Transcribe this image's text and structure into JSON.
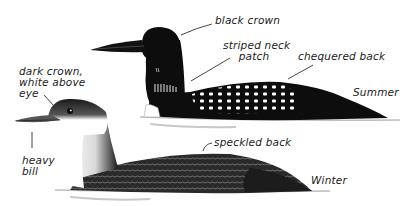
{
  "figure": {
    "birds": [
      {
        "id": "summer",
        "season_label": "Summer",
        "annotations": [
          {
            "id": "black-crown",
            "text": "black crown"
          },
          {
            "id": "striped-neck-patch",
            "line1": "striped neck",
            "line2": "patch"
          },
          {
            "id": "chequered-back",
            "text": "chequered back"
          }
        ]
      },
      {
        "id": "winter",
        "season_label": "Winter",
        "annotations": [
          {
            "id": "dark-crown",
            "line1": "dark crown,",
            "line2": "white above",
            "line3": "eye"
          },
          {
            "id": "heavy-bill",
            "line1": "heavy",
            "line2": "bill"
          },
          {
            "id": "speckled-back",
            "text": "speckled back"
          }
        ]
      }
    ]
  },
  "colors": {
    "background": "#ffffff",
    "ink": "#111111",
    "grey": "#6e6e6e",
    "light_grey": "#cfcfcf"
  }
}
